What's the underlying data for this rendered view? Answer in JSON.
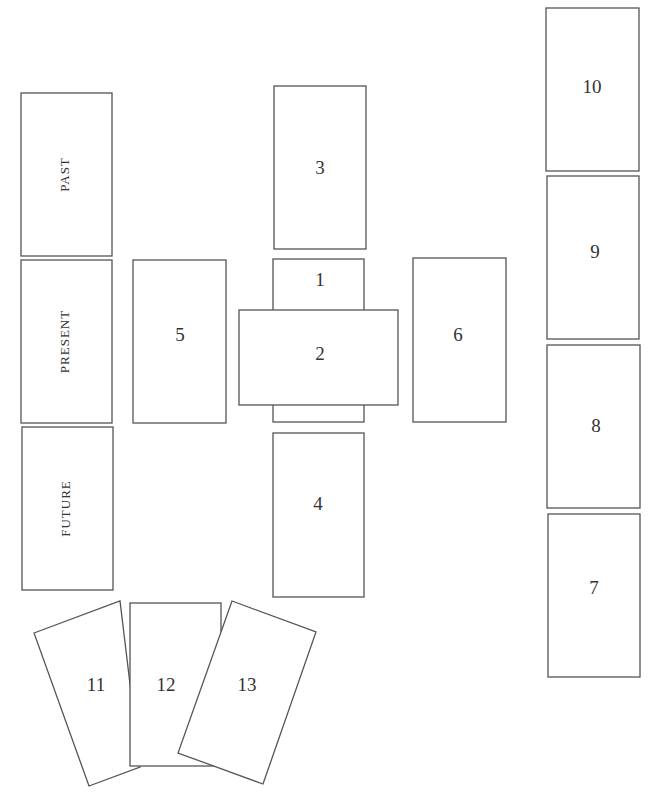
{
  "diagram": {
    "type": "tarot-card-spread",
    "time_column": [
      {
        "id": "past",
        "label": "PAST"
      },
      {
        "id": "present",
        "label": "PRESENT"
      },
      {
        "id": "future",
        "label": "FUTURE"
      }
    ],
    "cross": [
      {
        "id": "card-1",
        "label": "1"
      },
      {
        "id": "card-2",
        "label": "2"
      },
      {
        "id": "card-3",
        "label": "3"
      },
      {
        "id": "card-4",
        "label": "4"
      },
      {
        "id": "card-5",
        "label": "5"
      },
      {
        "id": "card-6",
        "label": "6"
      }
    ],
    "staff": [
      {
        "id": "card-7",
        "label": "7"
      },
      {
        "id": "card-8",
        "label": "8"
      },
      {
        "id": "card-9",
        "label": "9"
      },
      {
        "id": "card-10",
        "label": "10"
      }
    ],
    "fan": [
      {
        "id": "card-11",
        "label": "11"
      },
      {
        "id": "card-12",
        "label": "12"
      },
      {
        "id": "card-13",
        "label": "13"
      }
    ]
  }
}
